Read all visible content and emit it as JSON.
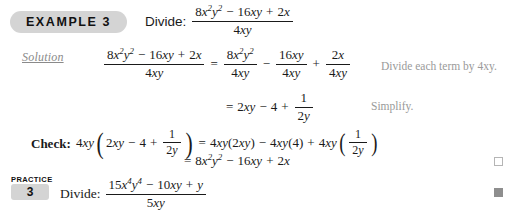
{
  "example": {
    "badge_label": "EXAMPLE 3",
    "command": "Divide:",
    "problem": {
      "numerator": "8x²y² − 16xy + 2x",
      "denominator": "4xy"
    }
  },
  "solution": {
    "label": "Solution",
    "line1": {
      "lhs_numerator": "8x²y² − 16xy + 2x",
      "lhs_denominator": "4xy",
      "equals": "=",
      "term1_numerator": "8x²y²",
      "term1_denominator": "4xy",
      "op1": "−",
      "term2_numerator": "16xy",
      "term2_denominator": "4xy",
      "op2": "+",
      "term3_numerator": "2x",
      "term3_denominator": "4xy",
      "note": "Divide each term by 4xy."
    },
    "line2": {
      "equals": "=",
      "expression": "2xy − 4 + 1/2y",
      "term1": "2xy",
      "op1": "−",
      "term2": "4",
      "op2": "+",
      "frac_numerator": "1",
      "frac_denominator": "2y",
      "note": "Simplify."
    }
  },
  "check": {
    "label": "Check:",
    "line1": {
      "factor": "4xy",
      "paren_open": "(",
      "inner_term1": "2xy",
      "inner_op1": "−",
      "inner_term2": "4",
      "inner_op2": "+",
      "inner_frac_numerator": "1",
      "inner_frac_denominator": "2y",
      "paren_close": ")",
      "equals": "=",
      "rhs_term1": "4xy(2xy)",
      "rhs_op1": "−",
      "rhs_term2": "4xy(4)",
      "rhs_op2": "+",
      "rhs_term3_factor": "4xy",
      "rhs_term3_frac_numerator": "1",
      "rhs_term3_frac_denominator": "2y"
    },
    "line2": {
      "equals": "=",
      "result": "8x²y² − 16xy + 2x"
    },
    "end_marker": "open-square"
  },
  "practice": {
    "kicker": "PRACTICE",
    "number": "3",
    "command": "Divide:",
    "problem": {
      "numerator": "15x⁴y⁴ − 10xy + y",
      "denominator": "5xy"
    },
    "end_marker": "filled-square"
  },
  "symbols": {
    "minus": "−",
    "plus": "+",
    "equals": "=",
    "paren_open": "(",
    "paren_close": ")"
  },
  "colors": {
    "badge_gray": "#d4d4d4",
    "note_gray": "#9a9a9a",
    "solution_gray": "#8a8a8a",
    "text_black": "#1a1a1a",
    "background": "#ffffff",
    "marker_gray": "#8e8e8e"
  }
}
